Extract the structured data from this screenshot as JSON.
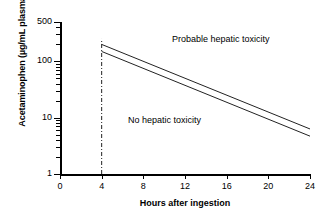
{
  "chart_data": {
    "type": "line",
    "title": "",
    "xlabel": "Hours after ingestion",
    "ylabel": "Acetaminophen (µg/mL plasma)",
    "xlim": [
      0,
      24
    ],
    "ylim": [
      1,
      500
    ],
    "yscale": "log",
    "grid": false,
    "legend_position": "none",
    "xticks": [
      0,
      4,
      8,
      12,
      16,
      20,
      24
    ],
    "xticklabels": [
      "0",
      "4",
      "8",
      "12",
      "16",
      "20",
      "24"
    ],
    "yticks": [
      1,
      10,
      100,
      500
    ],
    "yticklabels": [
      "1",
      "10",
      "100",
      "500"
    ],
    "yminorticks": [
      2,
      3,
      4,
      5,
      6,
      7,
      8,
      9,
      20,
      30,
      40,
      50,
      60,
      70,
      80,
      90,
      200,
      300,
      400
    ],
    "series": [
      {
        "name": "upper-treatment-line",
        "style": "solid",
        "x": [
          4,
          24
        ],
        "y": [
          200,
          6.3
        ]
      },
      {
        "name": "lower-treatment-line",
        "style": "solid",
        "x": [
          4,
          24
        ],
        "y": [
          150,
          4.7
        ]
      },
      {
        "name": "four-hour-marker",
        "style": "dash-dot",
        "x": [
          4,
          4
        ],
        "y": [
          1,
          250
        ]
      }
    ],
    "annotations": [
      {
        "text": "Probable hepatic toxicity",
        "x": 13.0,
        "y": 190
      },
      {
        "text": "No hepatic toxicity",
        "x": 8.6,
        "y": 8.5
      }
    ]
  },
  "axes": {
    "y_title": "Acetaminophen (µg/mL plasma)",
    "x_title": "Hours after ingestion"
  },
  "regions": {
    "probable": "Probable hepatic toxicity",
    "none": "No hepatic toxicity"
  },
  "colors": {
    "axis": "#000000",
    "line": "#222222",
    "background": "#ffffff"
  }
}
